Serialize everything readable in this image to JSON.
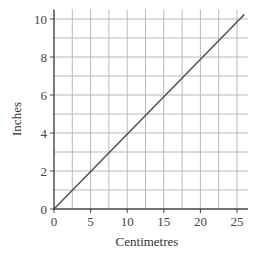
{
  "chart_data": {
    "type": "line",
    "title": "",
    "xlabel": "Centimetres",
    "ylabel": "Inches",
    "xlim": [
      0,
      26.5
    ],
    "ylim": [
      0,
      10.5
    ],
    "x_ticks": [
      0,
      5,
      10,
      15,
      20,
      25
    ],
    "y_ticks": [
      0,
      2,
      4,
      6,
      8,
      10
    ],
    "x_grid_step": 2.5,
    "y_grid_step": 1,
    "grid": true,
    "legend": null,
    "series": [
      {
        "name": "conversion",
        "x": [
          0,
          25.4,
          26
        ],
        "y": [
          0,
          10,
          10.24
        ],
        "color": "#555555"
      }
    ]
  },
  "labels": {
    "xlabel": "Centimetres",
    "ylabel": "Inches",
    "xticks": [
      "0",
      "5",
      "10",
      "15",
      "20",
      "25"
    ],
    "yticks": [
      "0",
      "2",
      "4",
      "6",
      "8",
      "10"
    ]
  }
}
